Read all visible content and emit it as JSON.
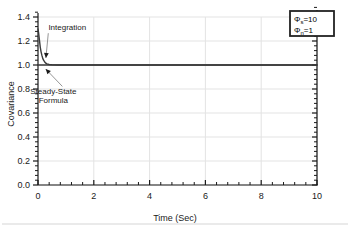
{
  "chart_data": {
    "type": "line",
    "title": "",
    "xlabel": "Time (Sec)",
    "ylabel": "Covariance",
    "xlim": [
      0,
      10
    ],
    "ylim": [
      0,
      1.4
    ],
    "grid": true,
    "x_ticks": [
      "0",
      "2",
      "4",
      "6",
      "8",
      "10"
    ],
    "x_tick_values": [
      0,
      2,
      4,
      6,
      8,
      10
    ],
    "x_minor_per_major": 5,
    "y_ticks": [
      "0.0",
      "0.2",
      "0.4",
      "0.6",
      "0.8",
      "1.0",
      "1.2",
      "1.4"
    ],
    "y_tick_values": [
      0.0,
      0.2,
      0.4,
      0.6,
      0.8,
      1.0,
      1.2,
      1.4
    ],
    "y_minor_per_major": 4,
    "series": [
      {
        "name": "Integration",
        "x": [
          0.0,
          0.02,
          0.05,
          0.08,
          0.11,
          0.14,
          0.17,
          0.2,
          0.24,
          0.28,
          0.32,
          0.4,
          0.5,
          0.7,
          1.0,
          1.5,
          2.0,
          3.0,
          4.0,
          5.0,
          6.0,
          7.0,
          8.0,
          9.0,
          10.0
        ],
        "y": [
          1.3,
          1.27,
          1.21,
          1.15,
          1.11,
          1.08,
          1.055,
          1.04,
          1.025,
          1.015,
          1.009,
          1.004,
          1.002,
          1.0,
          1.0,
          1.0,
          1.0,
          1.0,
          1.0,
          1.0,
          1.0,
          1.0,
          1.0,
          1.0,
          1.0
        ]
      },
      {
        "name": "Steady-State Formula",
        "x": [
          0.0,
          10.0
        ],
        "y": [
          1.0,
          1.0
        ]
      }
    ],
    "annotations": [
      {
        "label": "Integration",
        "text_x": 1.05,
        "text_y": 1.315,
        "point_x": 0.23,
        "point_y": 1.055
      },
      {
        "label_line1": "Steady-State",
        "label_line2": "Formula",
        "text_x": 0.55,
        "text_y": 0.78,
        "point_x": 0.24,
        "point_y": 0.975
      }
    ],
    "legend": {
      "position": "top-right",
      "entries": [
        {
          "symbol": "Φ",
          "subscript": "s",
          "equals": "=10"
        },
        {
          "symbol": "Φ",
          "subscript": "n",
          "equals": "=1"
        }
      ]
    },
    "colors": {
      "curve": "#3a3a3a",
      "grid": "#e3e3e3",
      "axis": "#1a1a1a",
      "background": "#ffffff",
      "annotation_line": "#8a8a8a",
      "legend_border": "#222222"
    }
  }
}
